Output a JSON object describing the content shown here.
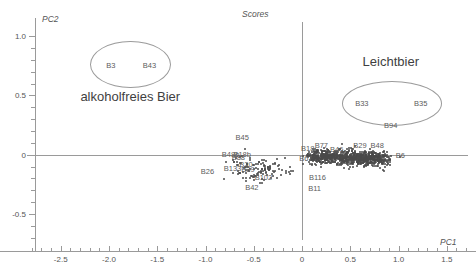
{
  "chart_data": {
    "type": "scatter",
    "title": "Scores",
    "xlabel": "PC1",
    "ylabel": "PC2",
    "xlim": [
      -2.85,
      1.72
    ],
    "ylim": [
      -0.72,
      1.12
    ],
    "grid": false,
    "legend": "none",
    "xticks": [
      -2.5,
      -2.0,
      -1.5,
      -1.0,
      -0.5,
      0,
      0.5,
      1.0,
      1.5
    ],
    "xticklabels": [
      "-2.5",
      "-2.0",
      "-1.5",
      "-1.0",
      "-0.5",
      "0",
      "0.5",
      "1.0",
      "1.5"
    ],
    "yticks": [
      1.0,
      0.5,
      0,
      -0.5
    ],
    "yticklabels": [
      "1.0",
      "0.5",
      "0",
      "-0.5"
    ],
    "x_minor_step": 0.1,
    "y_minor_step": 0.1,
    "annotations": [
      {
        "text": "alkoholfreies Bier",
        "x": -1.78,
        "y": 0.49
      },
      {
        "text": "Leichtbier",
        "x": 0.92,
        "y": 0.78
      }
    ],
    "ellipses": [
      {
        "name": "alkoholfreies-Bier",
        "cx": -1.78,
        "cy": 0.76,
        "rx": 0.42,
        "ry": 0.2
      },
      {
        "name": "Leichtbier",
        "cx": 0.93,
        "cy": 0.43,
        "rx": 0.52,
        "ry": 0.19
      }
    ],
    "labeled_points": [
      {
        "label": "B3",
        "x": -1.98,
        "y": 0.76
      },
      {
        "label": "B43",
        "x": -1.58,
        "y": 0.76
      },
      {
        "label": "B33",
        "x": 0.62,
        "y": 0.44
      },
      {
        "label": "B35",
        "x": 1.23,
        "y": 0.44
      },
      {
        "label": "B94",
        "x": 0.92,
        "y": 0.25
      },
      {
        "label": "B45",
        "x": -0.62,
        "y": 0.15
      },
      {
        "label": "B29",
        "x": 0.6,
        "y": 0.08
      },
      {
        "label": "B48",
        "x": 0.78,
        "y": 0.08
      },
      {
        "label": "B77",
        "x": 0.2,
        "y": 0.08
      },
      {
        "label": "B18",
        "x": 0.06,
        "y": 0.06
      },
      {
        "label": "B46",
        "x": 0.36,
        "y": 0.05
      },
      {
        "label": "B48b",
        "x": -0.74,
        "y": 0.01
      },
      {
        "label": "B18b",
        "x": -0.62,
        "y": 0.01
      },
      {
        "label": "B88",
        "x": -0.66,
        "y": -0.02
      },
      {
        "label": "B6",
        "x": 1.02,
        "y": 0.0
      },
      {
        "label": "B67",
        "x": 0.04,
        "y": -0.03
      },
      {
        "label": "B20",
        "x": -0.58,
        "y": -0.08
      },
      {
        "label": "B133",
        "x": -0.72,
        "y": -0.11
      },
      {
        "label": "B39",
        "x": -0.56,
        "y": -0.12
      },
      {
        "label": "B26",
        "x": -0.98,
        "y": -0.14
      },
      {
        "label": "B102",
        "x": -0.4,
        "y": -0.19
      },
      {
        "label": "B116",
        "x": 0.16,
        "y": -0.19
      },
      {
        "label": "B42",
        "x": -0.52,
        "y": -0.27
      },
      {
        "label": "B11",
        "x": 0.13,
        "y": -0.28
      }
    ],
    "cluster_note": "dense unlabeled point cloud centred near PC1 0.0 to 0.9, PC2 -0.08 to 0.05"
  }
}
